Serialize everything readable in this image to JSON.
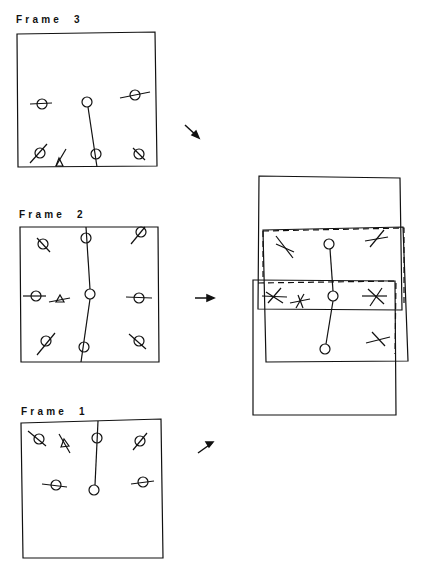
{
  "frames": [
    {
      "id": "frame3",
      "label": "Frame  3"
    },
    {
      "id": "frame2",
      "label": "Frame  2"
    },
    {
      "id": "frame1",
      "label": "Frame  1"
    }
  ],
  "arrows": [
    {
      "id": "arrow-frame3",
      "direction": "down-right"
    },
    {
      "id": "arrow-frame2",
      "direction": "right"
    },
    {
      "id": "arrow-frame1",
      "direction": "up-right"
    }
  ],
  "composite": {
    "description": "overlay of frames 1-3 with mosaic alignment"
  },
  "colors": {
    "ink": "#111111",
    "background": "#ffffff"
  }
}
